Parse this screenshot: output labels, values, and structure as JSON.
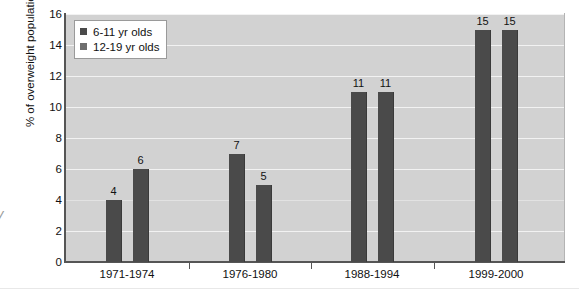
{
  "chart_data": {
    "type": "bar",
    "title": "",
    "subtitle": "",
    "xlabel": "",
    "ylabel": "% of overweight population",
    "categories": [
      "1971-1974",
      "1976-1980",
      "1988-1994",
      "1999-2000"
    ],
    "series": [
      {
        "name": "6-11 yr olds",
        "values": [
          4,
          7,
          11,
          15
        ],
        "color": "#4a4a4a"
      },
      {
        "name": "12-19 yr olds",
        "values": [
          6,
          5,
          11,
          15
        ],
        "color": "#4a4a4a"
      }
    ],
    "ylim": [
      0,
      16
    ],
    "yticks": [
      0,
      2,
      4,
      6,
      8,
      10,
      12,
      14,
      16
    ],
    "ytick_labels": [
      "0",
      "2",
      "4",
      "6",
      "8",
      "10",
      "12",
      "14",
      "16"
    ],
    "grid": true,
    "grid_orientation": "horizontal",
    "legend_position": "top-left",
    "show_value_labels": true,
    "plot_background": "#d2d2d2",
    "gridline_color": "#f2f2f2",
    "axis_color": "#555555"
  },
  "legend": {
    "items": [
      {
        "label": "6-11 yr olds",
        "swatch_color": "#4a4a4a"
      },
      {
        "label": "12-19 yr olds",
        "swatch_color": "#6e6e6e"
      }
    ]
  },
  "axes": {
    "y_title": "% of overweight population",
    "y_tick_labels": [
      "16",
      "14",
      "12",
      "10",
      "8",
      "6",
      "4",
      "2",
      "0"
    ],
    "x_tick_labels": [
      "1971-1974",
      "1976-1980",
      "1988-1994",
      "1999-2000"
    ]
  },
  "bar_value_labels": [
    "4",
    "6",
    "7",
    "5",
    "11",
    "11",
    "15",
    "15"
  ],
  "edge_artifact": {
    "glyph": "y"
  }
}
